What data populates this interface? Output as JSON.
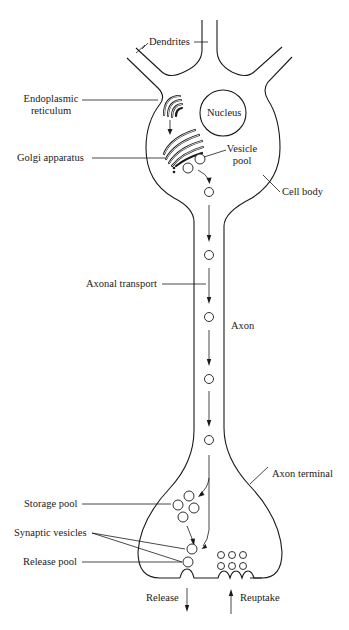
{
  "diagram": {
    "colors": {
      "stroke": "#1a1a1a",
      "background": "#ffffff"
    },
    "labels": {
      "dendrites": "Dendrites",
      "endoplasmic_reticulum_line1": "Endoplasmic",
      "endoplasmic_reticulum_line2": "reticulum",
      "nucleus": "Nucleus",
      "golgi_apparatus": "Golgi apparatus",
      "vesicle_pool_line1": "Vesicle",
      "vesicle_pool_line2": "pool",
      "cell_body": "Cell body",
      "axonal_transport": "Axonal transport",
      "axon": "Axon",
      "axon_terminal": "Axon terminal",
      "storage_pool": "Storage pool",
      "synaptic_vesicles": "Synaptic vesicles",
      "release_pool": "Release pool",
      "release": "Release",
      "reuptake": "Reuptake"
    },
    "structures": [
      "dendrites",
      "cell-body",
      "nucleus",
      "endoplasmic-reticulum",
      "golgi-apparatus",
      "vesicle-pool",
      "axon",
      "axonal-transport",
      "axon-terminal",
      "storage-pool",
      "release-pool",
      "synaptic-vesicles",
      "release-arrow",
      "reuptake-arrow"
    ],
    "axonal_transport_vesicle_count": 5,
    "storage_pool_vesicle_count": 4,
    "release_pool_vesicle_count": 2,
    "reuptake_vesicle_grid": "3x2"
  }
}
